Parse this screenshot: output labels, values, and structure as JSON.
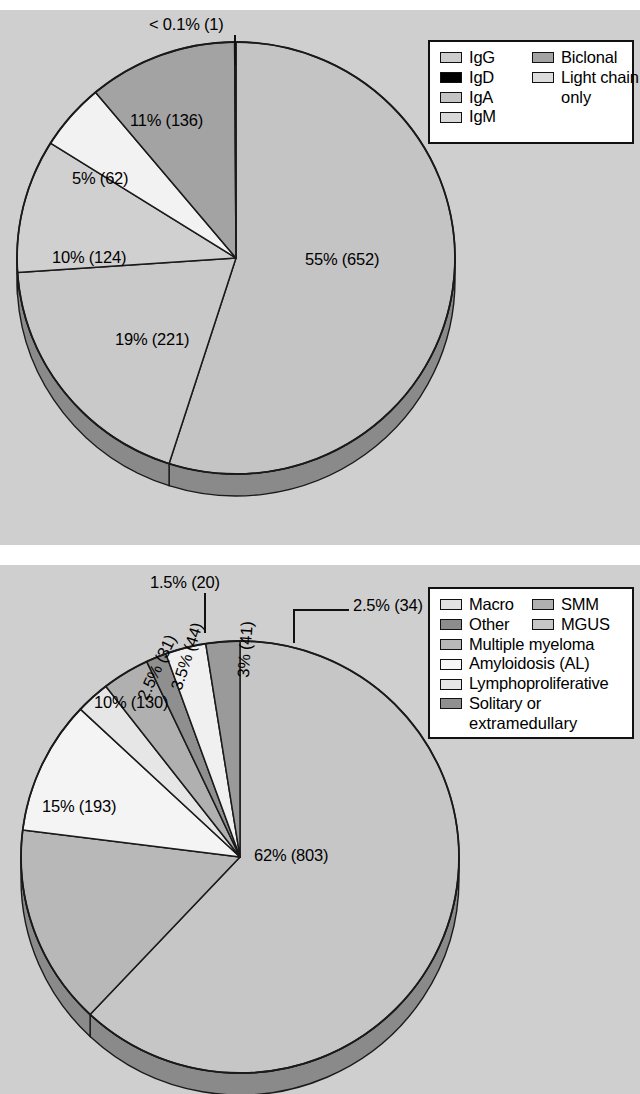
{
  "figure": {
    "background": "#cfcfcf",
    "panel_count": 2
  },
  "chart_data": [
    {
      "type": "pie",
      "title": "",
      "id": "monoclonal-protein-isotype",
      "total": 1196,
      "legend_position": "top-right",
      "categories": [
        "IgG",
        "IgA",
        "IgM",
        "Light chain only",
        "Biclonal",
        "IgD"
      ],
      "values": [
        652,
        221,
        124,
        62,
        136,
        1
      ],
      "percent_labels": [
        "55% (652)",
        "19% (221)",
        "10% (124)",
        "5% (62)",
        "11% (136)",
        "< 0.1% (1)"
      ],
      "percents": [
        55,
        19,
        10,
        5,
        11,
        0.1
      ],
      "colors": [
        "#c4c4c4",
        "#c9c9c9",
        "#d0d0d0",
        "#f2f2f2",
        "#a3a3a3",
        "#000000"
      ],
      "side_color": "#8a8a8a",
      "legend": {
        "rows": [
          [
            {
              "label": "IgG",
              "color": "#cdcdcd"
            },
            {
              "label": "Biclonal",
              "color": "#a3a3a3"
            }
          ],
          [
            {
              "label": "IgD",
              "color": "#000000"
            },
            {
              "label": "Light chain",
              "color": "#dcdcdc"
            }
          ],
          [
            {
              "label": "IgA",
              "color": "#c4c4c4"
            },
            {
              "label": "",
              "color": ""
            }
          ],
          [
            {
              "label": "IgM",
              "color": "#d8d8d8"
            },
            {
              "label": "",
              "color": ""
            }
          ]
        ],
        "continuation": "only"
      }
    },
    {
      "type": "pie",
      "title": "",
      "id": "monoclonal-gammopathy-diagnosis",
      "total": 1296,
      "legend_position": "top-right",
      "categories": [
        "MGUS",
        "Multiple myeloma",
        "Amyloidosis (AL)",
        "Lymphoproliferative",
        "SMM",
        "Solitary or extramedullary",
        "Macro",
        "Other"
      ],
      "values": [
        803,
        193,
        130,
        31,
        44,
        20,
        41,
        34
      ],
      "percent_labels": [
        "62% (803)",
        "15% (193)",
        "10% (130)",
        "2.5% (31)",
        "3.5% (44)",
        "1.5% (20)",
        "3% (41)",
        "2.5% (34)"
      ],
      "percents": [
        62,
        15,
        10,
        2.5,
        3.5,
        1.5,
        3,
        2.5
      ],
      "colors": [
        "#c6c6c6",
        "#b8b8b8",
        "#f4f4f4",
        "#e6e6e6",
        "#b0b0b0",
        "#8f8f8f",
        "#f0f0f0",
        "#9a9a9a"
      ],
      "side_color": "#8a8a8a",
      "legend": {
        "rows": [
          [
            {
              "label": "Macro",
              "color": "#e2e2e2"
            },
            {
              "label": "SMM",
              "color": "#b0b0b0"
            }
          ],
          [
            {
              "label": "Other",
              "color": "#8c8c8c"
            },
            {
              "label": "MGUS",
              "color": "#c6c6c6"
            }
          ],
          [
            {
              "label": "Multiple myeloma",
              "color": "#b8b8b8"
            }
          ],
          [
            {
              "label": "Amyloidosis (AL)",
              "color": "#f7f7f7"
            }
          ],
          [
            {
              "label": "Lymphoproliferative",
              "color": "#e6e6e6"
            }
          ],
          [
            {
              "label": "Solitary or",
              "color": "#8f8f8f"
            }
          ]
        ],
        "continuation": "extramedullary"
      }
    }
  ]
}
